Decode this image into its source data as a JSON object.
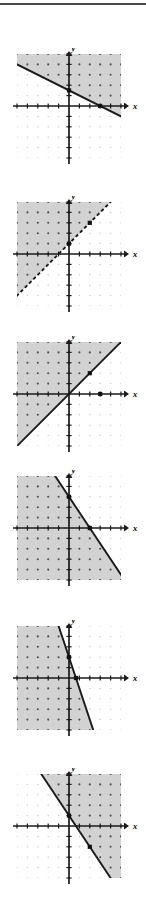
{
  "page": {
    "width": 146,
    "height": 916,
    "background_color": "#ffffff",
    "top_rule_color": "#4a4a4a"
  },
  "style": {
    "shade_fill": "#d2d2d2",
    "shade_dot_color": "#4f4f4f",
    "plain_dot_color": "#c9c9c9",
    "axis_color": "#1a1a1a",
    "line_color": "#1a1a1a",
    "marker_color": "#111111",
    "label_color": "#000000"
  },
  "axis_labels": {
    "x": "x",
    "y": "y"
  },
  "chart_data": [
    {
      "id": "graph-1",
      "type": "line",
      "title": "",
      "xlabel": "x",
      "ylabel": "y",
      "xlim": [
        -5,
        5
      ],
      "ylim": [
        -5,
        5
      ],
      "grid": "dots",
      "boundary": {
        "style": "solid",
        "slope": -0.5,
        "intercept": 1.5,
        "x_intercept": 3,
        "y_intercept": 1.5,
        "label": "y = -1/2 x + 3/2"
      },
      "shading": "above",
      "shaded_region_description": "half-plane above and right of the line",
      "markers": [
        {
          "x": 0,
          "y": 1.5
        },
        {
          "x": 3,
          "y": 0
        }
      ]
    },
    {
      "id": "graph-2",
      "type": "line",
      "title": "",
      "xlabel": "x",
      "ylabel": "y",
      "xlim": [
        -5,
        5
      ],
      "ylim": [
        -5,
        5
      ],
      "grid": "dots",
      "boundary": {
        "style": "dashed",
        "slope": 1,
        "intercept": 1,
        "x_intercept": -1,
        "y_intercept": 1,
        "label": "y = x + 1"
      },
      "shading": "above",
      "shaded_region_description": "half-plane above and left of the dashed line",
      "markers": [
        {
          "x": 0,
          "y": 1
        },
        {
          "x": 2,
          "y": 3
        }
      ]
    },
    {
      "id": "graph-3",
      "type": "line",
      "title": "",
      "xlabel": "x",
      "ylabel": "y",
      "xlim": [
        -5,
        5
      ],
      "ylim": [
        -5,
        5
      ],
      "grid": "dots",
      "boundary": {
        "style": "solid",
        "slope": 1,
        "intercept": 0,
        "x_intercept": 0,
        "y_intercept": 0,
        "label": "y = x"
      },
      "shading": "above",
      "shaded_region_description": "half-plane above and left of the line",
      "markers": [
        {
          "x": 2,
          "y": 2
        },
        {
          "x": 3,
          "y": 0
        }
      ]
    },
    {
      "id": "graph-4",
      "type": "line",
      "title": "",
      "xlabel": "x",
      "ylabel": "y",
      "xlim": [
        -5,
        5
      ],
      "ylim": [
        -5,
        5
      ],
      "grid": "dots",
      "boundary": {
        "style": "solid",
        "slope": -1.5,
        "intercept": 3,
        "x_intercept": 2,
        "y_intercept": 3,
        "label": "y = -3/2 x + 3"
      },
      "shading": "below",
      "shaded_region_description": "half-plane below and left of the line",
      "markers": [
        {
          "x": 0,
          "y": 3
        },
        {
          "x": 2,
          "y": 0
        }
      ]
    },
    {
      "id": "graph-5",
      "type": "line",
      "title": "",
      "xlabel": "x",
      "ylabel": "y",
      "xlim": [
        -5,
        5
      ],
      "ylim": [
        -5,
        5
      ],
      "grid": "dots",
      "boundary": {
        "style": "solid",
        "slope": -3,
        "intercept": 2,
        "x_intercept": 0.67,
        "y_intercept": 2,
        "label": "y = -3x + 2"
      },
      "shading": "right",
      "shaded_region_description": "half-plane to the right of the steep line",
      "markers": [
        {
          "x": 0,
          "y": 2
        },
        {
          "x": 0.67,
          "y": 0
        }
      ]
    },
    {
      "id": "graph-6",
      "type": "line",
      "title": "",
      "xlabel": "x",
      "ylabel": "y",
      "xlim": [
        -5,
        5
      ],
      "ylim": [
        -5,
        5
      ],
      "grid": "dots",
      "boundary": {
        "style": "solid",
        "slope": -1.5,
        "intercept": 1,
        "x_intercept": 0.67,
        "y_intercept": 1,
        "label": "y = -3/2 x + 1"
      },
      "shading": "above",
      "shaded_region_description": "half-plane above and right of the line",
      "markers": [
        {
          "x": 0,
          "y": 1
        },
        {
          "x": 2,
          "y": -2
        }
      ]
    }
  ]
}
